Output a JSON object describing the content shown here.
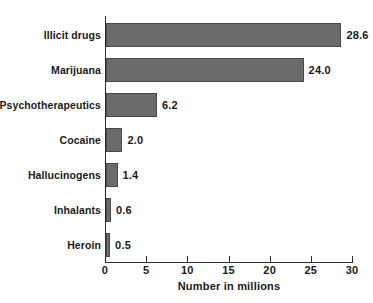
{
  "chart_data": {
    "type": "bar",
    "orientation": "horizontal",
    "title": "",
    "subtitle": "",
    "xlabel": "Number in millions",
    "ylabel": "",
    "xlim": [
      0,
      30
    ],
    "xticks": [
      0,
      5,
      10,
      15,
      20,
      25,
      30
    ],
    "xtick_labels": [
      "0",
      "5",
      "10",
      "15",
      "20",
      "25",
      "30"
    ],
    "grid": false,
    "legend": null,
    "categories": [
      "Illicit drugs",
      "Marijuana",
      "Psychotherapeutics",
      "Cocaine",
      "Hallucinogens",
      "Inhalants",
      "Heroin"
    ],
    "values": [
      28.6,
      24.0,
      6.2,
      2.0,
      1.4,
      0.6,
      0.5
    ],
    "value_labels": [
      "28.6",
      "24.0",
      "6.2",
      "2.0",
      "1.4",
      "0.6",
      "0.5"
    ],
    "bar_color": "#6b6b6b",
    "bar_edge_color": "#4a4a4a",
    "background_color": "#ffffff",
    "axis_color": "#2b2b2b",
    "text_color": "#1a1a1a"
  }
}
